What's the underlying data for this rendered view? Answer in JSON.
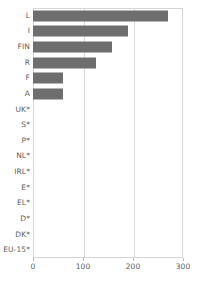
{
  "chart_data": {
    "type": "bar",
    "orientation": "horizontal",
    "title": "",
    "subtitle": "",
    "xlabel": "",
    "ylabel": "",
    "xlim": [
      0,
      300
    ],
    "xticks": [
      0,
      100,
      200,
      300
    ],
    "xtick_labels": [
      "0",
      "100",
      "200",
      "300"
    ],
    "grid": "vertical",
    "legend": "none",
    "bar_color": "#6e6e6e",
    "axis_color": "#d6d6d6",
    "grid_color": "#d9d9d9",
    "text_color": "#5d5d5d",
    "categories": [
      "L",
      "I",
      "FIN",
      "R",
      "F",
      "A",
      "UK*",
      "S*",
      "P*",
      "NL*",
      "IRL*",
      "E*",
      "EL*",
      "D*",
      "DK*",
      "EU-15*"
    ],
    "values": [
      270,
      190,
      157,
      126,
      60,
      60,
      0,
      0,
      0,
      0,
      0,
      0,
      0,
      0,
      0,
      0
    ]
  }
}
